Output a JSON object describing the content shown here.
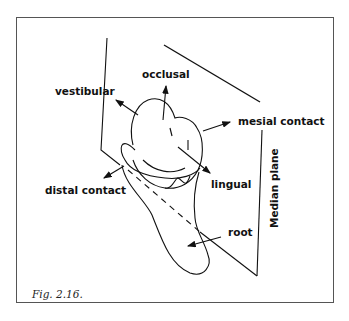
{
  "figure": {
    "caption": "Fig. 2.16.",
    "labels": {
      "occlusal": "occlusal",
      "vestibular": "vestibular",
      "mesial_contact": "mesial contact",
      "distal_contact": "distal contact",
      "lingual": "lingual",
      "root": "root",
      "median_plane": "Median plane"
    },
    "line_color": "#111111",
    "frame_color": "#555555"
  }
}
